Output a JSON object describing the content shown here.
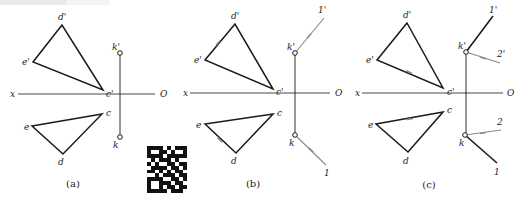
{
  "figure": {
    "header_fragment": "",
    "colors": {
      "line": "#1a1a1a",
      "construction_line": "#8a8a8a",
      "axis": "#333333"
    },
    "axis_labels": {
      "left": "x",
      "right": "O"
    },
    "panels": [
      {
        "id": "a",
        "caption": "(a)",
        "axis": {
          "y": 94,
          "x1": 18,
          "x2": 155,
          "x_label_x": 10,
          "o_label_x": 160
        },
        "projection_connector": {
          "x": 120,
          "y1": 53,
          "y2": 137
        },
        "front_triangle": {
          "vertices": {
            "d'": [
              62,
              25
            ],
            "e'": [
              33,
              62
            ],
            "c'": [
              103,
              90
            ]
          },
          "labels": [
            {
              "text": "d'",
              "x": 58,
              "y": 20
            },
            {
              "text": "e'",
              "x": 22,
              "y": 65
            },
            {
              "text": "c'",
              "x": 106,
              "y": 97
            }
          ]
        },
        "top_triangle": {
          "vertices": {
            "c": [
              102,
              114
            ],
            "e": [
              32,
              126
            ],
            "d": [
              63,
              154
            ]
          },
          "labels": [
            {
              "text": "c",
              "x": 106,
              "y": 116
            },
            {
              "text": "e",
              "x": 24,
              "y": 130
            },
            {
              "text": "d",
              "x": 58,
              "y": 165
            }
          ]
        },
        "points": [
          {
            "name": "k'",
            "x": 120,
            "y": 53,
            "label_x": 112,
            "label_y": 50
          },
          {
            "name": "k",
            "x": 120,
            "y": 137,
            "label_x": 113,
            "label_y": 148
          }
        ],
        "lines": [],
        "ticks": [],
        "caption_pos": {
          "x": 73,
          "y": 187
        }
      },
      {
        "id": "b",
        "caption": "(b)",
        "axis": {
          "y": 93,
          "x1": 190,
          "x2": 330,
          "x_label_x": 183,
          "o_label_x": 335
        },
        "projection_connector": {
          "x": 295,
          "y1": 53,
          "y2": 135
        },
        "front_triangle": {
          "vertices": {
            "d'": [
              235,
              24
            ],
            "e'": [
              205,
              60
            ],
            "c'": [
              273,
              89
            ]
          },
          "labels": [
            {
              "text": "d'",
              "x": 231,
              "y": 19
            },
            {
              "text": "e'",
              "x": 194,
              "y": 63
            },
            {
              "text": "c'",
              "x": 276,
              "y": 95
            }
          ]
        },
        "top_triangle": {
          "vertices": {
            "c": [
              273,
              114
            ],
            "e": [
              205,
              124
            ],
            "d": [
              236,
              153
            ]
          },
          "labels": [
            {
              "text": "c",
              "x": 277,
              "y": 116
            },
            {
              "text": "e",
              "x": 196,
              "y": 128
            },
            {
              "text": "d",
              "x": 231,
              "y": 164
            }
          ]
        },
        "points": [
          {
            "name": "k'",
            "x": 295,
            "y": 53,
            "label_x": 287,
            "label_y": 50
          },
          {
            "name": "k",
            "x": 295,
            "y": 135,
            "label_x": 289,
            "label_y": 146
          }
        ],
        "lines": [
          {
            "from": [
              295,
              53
            ],
            "to": [
              324,
              18
            ],
            "style": "construction",
            "label": "1'",
            "label_x": 318,
            "label_y": 13
          },
          {
            "from": [
              295,
              135
            ],
            "to": [
              326,
              165
            ],
            "style": "construction",
            "label": "1",
            "label_x": 324,
            "label_y": 176
          }
        ],
        "ticks": [
          {
            "x": 218,
            "y": 43,
            "angle": -50
          },
          {
            "x": 220,
            "y": 140,
            "angle": 43
          },
          {
            "x": 309,
            "y": 36,
            "angle": -50
          },
          {
            "x": 311,
            "y": 150,
            "angle": 44
          }
        ],
        "caption_pos": {
          "x": 253,
          "y": 187
        }
      },
      {
        "id": "c",
        "caption": "(c)",
        "axis": {
          "y": 93,
          "x1": 362,
          "x2": 503,
          "x_label_x": 355,
          "o_label_x": 507
        },
        "projection_connector": {
          "x": 466,
          "y1": 52,
          "y2": 135
        },
        "front_triangle": {
          "vertices": {
            "d'": [
              407,
              23
            ],
            "e'": [
              377,
              60
            ],
            "c'": [
              443,
              88
            ]
          },
          "labels": [
            {
              "text": "d'",
              "x": 403,
              "y": 18
            },
            {
              "text": "e'",
              "x": 366,
              "y": 63
            },
            {
              "text": "c'",
              "x": 447,
              "y": 95
            }
          ]
        },
        "top_triangle": {
          "vertices": {
            "c": [
              443,
              112
            ],
            "e": [
              376,
              124
            ],
            "d": [
              408,
              152
            ]
          },
          "labels": [
            {
              "text": "c",
              "x": 447,
              "y": 113
            },
            {
              "text": "e",
              "x": 368,
              "y": 128
            },
            {
              "text": "d",
              "x": 403,
              "y": 164
            }
          ]
        },
        "points": [
          {
            "name": "k'",
            "x": 466,
            "y": 52,
            "label_x": 458,
            "label_y": 49
          },
          {
            "name": "k",
            "x": 465,
            "y": 135,
            "label_x": 459,
            "label_y": 146
          }
        ],
        "lines": [
          {
            "from": [
              466,
              52
            ],
            "to": [
              493,
              16
            ],
            "style": "solid",
            "label": "1'",
            "label_x": 489,
            "label_y": 13
          },
          {
            "from": [
              466,
              52
            ],
            "to": [
              500,
              63
            ],
            "style": "construction",
            "label": "2'",
            "label_x": 497,
            "label_y": 57
          },
          {
            "from": [
              465,
              135
            ],
            "to": [
              497,
              163
            ],
            "style": "solid",
            "label": "1",
            "label_x": 494,
            "label_y": 175
          },
          {
            "from": [
              465,
              135
            ],
            "to": [
              501,
              130
            ],
            "style": "construction",
            "label": "2",
            "label_x": 497,
            "label_y": 125
          }
        ],
        "ticks": [
          {
            "x": 409,
            "y": 72,
            "angle": 23
          },
          {
            "x": 410,
            "y": 119,
            "angle": -10
          },
          {
            "x": 483,
            "y": 58,
            "angle": 18
          },
          {
            "x": 483,
            "y": 133,
            "angle": -8
          }
        ],
        "caption_pos": {
          "x": 429,
          "y": 188
        }
      }
    ],
    "qr_code": {
      "present": true,
      "x": 147,
      "y": 146,
      "width": 40,
      "height": 47
    }
  }
}
